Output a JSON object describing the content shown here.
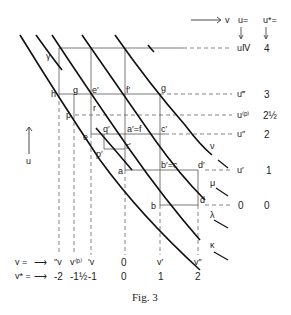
{
  "figure": {
    "caption": "Fig. 3",
    "axis_v_label": "v",
    "axis_u_label": "u"
  },
  "right_header": {
    "u_eq": "u=",
    "ustar_eq": "u*="
  },
  "u_levels": [
    {
      "u": "uⅣ",
      "ustar": "4"
    },
    {
      "u": "u‴",
      "ustar": "3"
    },
    {
      "u": "u⁽ᵖ⁾",
      "ustar": "2½"
    },
    {
      "u": "u″",
      "ustar": "2"
    },
    {
      "u": "u′",
      "ustar": "1"
    },
    {
      "u": "0",
      "ustar": "0"
    }
  ],
  "v_row": {
    "label": "v  =",
    "arrow": "⟶",
    "values": [
      "″v",
      "v⁽ᵖ⁾",
      "′v",
      "0",
      "v′",
      "v″"
    ]
  },
  "vstar_row": {
    "label": "v* =",
    "arrow": "⟶",
    "values": [
      "-2",
      "-1½",
      "-1",
      "0",
      "1",
      "2"
    ]
  },
  "points": {
    "h": "h",
    "g_left": "g",
    "e_prime": "e′",
    "f_prime": "f′",
    "g_right": "g",
    "r": "r",
    "p": "p",
    "q_prime": "q′",
    "a_prime_f": "a′=f",
    "c_prime": "c′",
    "e": "e",
    "r_prime": "r′",
    "p_prime": "p′",
    "a": "a",
    "b_prime_c": "b′=c",
    "d_prime": "d′",
    "b": "b",
    "d": "d",
    "gamma": "γ"
  },
  "curve_labels": {
    "nu": "ν",
    "mu": "μ",
    "lambda": "λ",
    "kappa": "κ"
  }
}
